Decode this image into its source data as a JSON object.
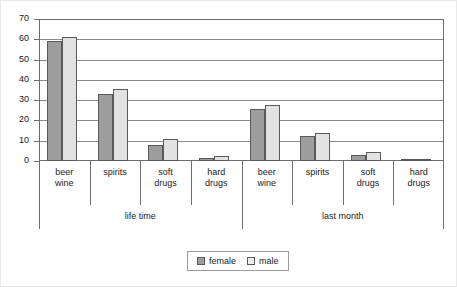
{
  "chart_data": {
    "type": "bar",
    "title": "",
    "subtitle": "",
    "xlabel": "",
    "ylabel": "",
    "ylim": [
      0,
      70
    ],
    "yticks": [
      0,
      10,
      20,
      30,
      40,
      50,
      60,
      70
    ],
    "grid": true,
    "legend_position": "bottom-center",
    "groups": [
      "life time",
      "last month"
    ],
    "categories": [
      "beer wine",
      "spirits",
      "soft drugs",
      "hard drugs",
      "beer wine",
      "spirits",
      "soft drugs",
      "hard drugs"
    ],
    "series": [
      {
        "name": "female",
        "color": "#9d9d9d",
        "values": [
          59,
          33,
          8,
          1.5,
          25.5,
          12.5,
          3,
          0.5
        ]
      },
      {
        "name": "male",
        "color": "#e2e2e2",
        "values": [
          61,
          35.5,
          11,
          2.5,
          27.5,
          14,
          4.5,
          1
        ]
      }
    ]
  },
  "axis": {
    "tick_labels": [
      "70",
      "60",
      "50",
      "40",
      "30",
      "20",
      "10",
      "0"
    ]
  },
  "categories_display": [
    {
      "line1": "beer",
      "line2": "wine"
    },
    {
      "line1": "spirits",
      "line2": ""
    },
    {
      "line1": "soft",
      "line2": "drugs"
    },
    {
      "line1": "hard",
      "line2": "drugs"
    },
    {
      "line1": "beer",
      "line2": "wine"
    },
    {
      "line1": "spirits",
      "line2": ""
    },
    {
      "line1": "soft",
      "line2": "drugs"
    },
    {
      "line1": "hard",
      "line2": "drugs"
    }
  ],
  "group_labels": [
    {
      "label": "life time"
    },
    {
      "label": "last month"
    }
  ],
  "legend": {
    "items": [
      {
        "label": "female",
        "color": "#9d9d9d"
      },
      {
        "label": "male",
        "color": "#eeeeee"
      }
    ]
  }
}
